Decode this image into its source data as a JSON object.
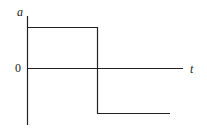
{
  "diagram": {
    "type": "acceleration-time graph (square wave)",
    "axes": {
      "y_label": "a",
      "x_label": "t",
      "origin_label": "0"
    },
    "segments": [
      {
        "name": "positive-level",
        "description": "constant positive acceleration from t=0 to switch time"
      },
      {
        "name": "transition",
        "description": "vertical drop from positive to negative level"
      },
      {
        "name": "negative-level",
        "description": "constant negative acceleration after switch time"
      }
    ],
    "colors": {
      "line": "#222222",
      "background": "#ffffff"
    }
  }
}
